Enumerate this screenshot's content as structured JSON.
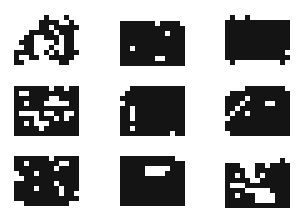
{
  "grid": {
    "cols": 13,
    "rows": 10,
    "cell_px": 5,
    "on_color": "#141414",
    "off_color": "#ffffff"
  },
  "patterns": [
    {
      "id": "p1",
      "x": 14,
      "y": 15,
      "rows": [
        "0000001000100",
        "0000011110010",
        "0000011011111",
        "0001111101110",
        "0011001110110",
        "0111000010110",
        "0011000100110",
        "1111001010111",
        "1001100111110",
        "1100000001100"
      ]
    },
    {
      "id": "p2",
      "x": 120,
      "y": 16,
      "rows": [
        "0000000000000",
        "1111111011110",
        "1111111111111",
        "1111111110111",
        "1111111111111",
        "1111111111111",
        "1101111111111",
        "1111111111111",
        "1111111001111",
        "1111111111111"
      ]
    },
    {
      "id": "p3",
      "x": 225,
      "y": 15,
      "rows": [
        "0100100000000",
        "1111111111111",
        "1111111111111",
        "1111111111111",
        "1111111111111",
        "1111111111111",
        "1111111111111",
        "1111111111110",
        "1111111111111",
        "0100000000010"
      ]
    },
    {
      "id": "p4",
      "x": 14,
      "y": 86,
      "rows": [
        "1111111011011",
        "1001111111111",
        "1111111001111",
        "1101110000011",
        "1111111111111",
        "1000010011001",
        "1111011101011",
        "1101000111111",
        "1111101111111",
        "1111111111111"
      ]
    },
    {
      "id": "p5",
      "x": 120,
      "y": 86,
      "rows": [
        "0011111111111",
        "0111111111111",
        "1111111111111",
        "0111111111111",
        "1101111111111",
        "1101111111111",
        "1101111111111",
        "1111111111111",
        "1101111111111",
        "1111111111011"
      ]
    },
    {
      "id": "p6",
      "x": 225,
      "y": 86,
      "rows": [
        "0000111111110",
        "0111111111111",
        "1111011111111",
        "1110111100111",
        "1101111111111",
        "1011011111111",
        "0111111111111",
        "1111111111111",
        "1111111111111",
        "0111111111111"
      ]
    },
    {
      "id": "p7",
      "x": 14,
      "y": 156,
      "rows": [
        "1111111011111",
        "1101111110011",
        "1111111101111",
        "0111011111111",
        "0011111111111",
        "1111111101111",
        "1111011110111",
        "1111111110110",
        "1111111111111",
        "0011111111100"
      ]
    },
    {
      "id": "p8",
      "x": 120,
      "y": 156,
      "rows": [
        "1111111111100",
        "1111111111111",
        "1111100000111",
        "1111100001111",
        "1111111111111",
        "1111111111111",
        "1111111111111",
        "1111111111111",
        "1111111111111",
        "1111111111111"
      ]
    },
    {
      "id": "p9",
      "x": 225,
      "y": 158,
      "rows": [
        "0000000000010",
        "1110001101111",
        "1111001111111",
        "1101001011111",
        "1111100111111",
        "1000111111111",
        "1111000001111",
        "1101110000111",
        "1111110000111",
        "1111111111111"
      ]
    }
  ]
}
